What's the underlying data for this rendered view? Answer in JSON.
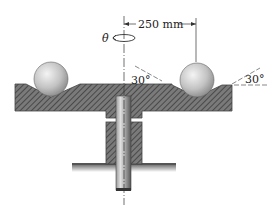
{
  "figure": {
    "type": "mechanics-diagram"
  },
  "labels": {
    "angular_rate": "θ̇",
    "radius_dimension": "250 mm",
    "left_angle": "30°",
    "right_angle": "30°"
  },
  "colors": {
    "hatch_fill": "#6e6e6e",
    "hatch_line": "#3a3a3a",
    "ball_light": "#e6e6e6",
    "ball_dark": "#8c8c8c",
    "line": "#333333"
  }
}
